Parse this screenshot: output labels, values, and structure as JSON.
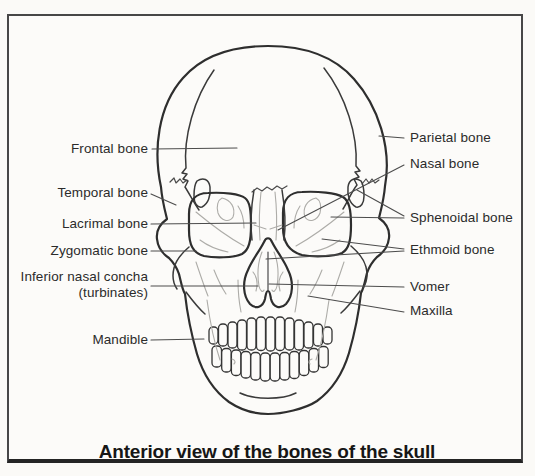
{
  "figure": {
    "caption": "Anterior view of the bones of the skull",
    "colors": {
      "paper": "#fcfbf9",
      "ink": "#343434",
      "detail_lines": "#adaca8",
      "frame_border": "#474747",
      "label_text": "#2b2b2b"
    },
    "labels": {
      "left": [
        {
          "text": "Frontal bone"
        },
        {
          "text": "Temporal bone"
        },
        {
          "text": "Lacrimal bone"
        },
        {
          "text": "Zygomatic bone"
        },
        {
          "text": "Inferior nasal concha",
          "text2": "(turbinates)"
        },
        {
          "text": "Mandible"
        }
      ],
      "right": [
        {
          "text": "Parietal bone"
        },
        {
          "text": "Nasal bone"
        },
        {
          "text": "Sphenoidal bone"
        },
        {
          "text": "Ethmoid bone"
        },
        {
          "text": "Vomer"
        },
        {
          "text": "Maxilla"
        }
      ]
    }
  }
}
